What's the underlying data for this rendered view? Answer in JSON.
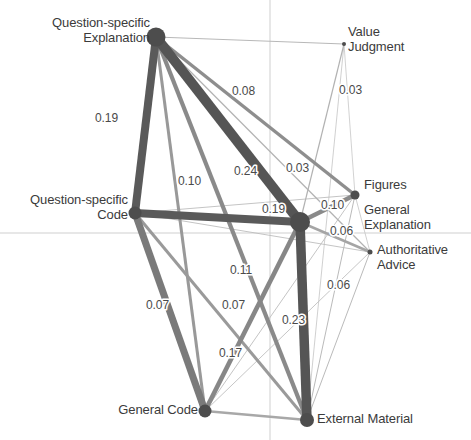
{
  "figure": {
    "type": "network-graph",
    "width": 471,
    "height": 440,
    "background_color": "#ffffff",
    "axis_color": "#cfcfcf",
    "node_color": "#4d4d4d",
    "edge_color_strong": "#5a5a5a",
    "edge_color_weak": "#b5b5b5",
    "label_color": "#3b3b3b"
  },
  "axes": {
    "horizontal_y": 233,
    "vertical_x": 270
  },
  "chart_data": {
    "type": "network",
    "title": "",
    "nodes": [
      {
        "id": "qs_explanation",
        "label": "Question-specific\nExplanation",
        "x": 156,
        "y": 37,
        "r": 9.5,
        "label_x": 150,
        "label_y": 16,
        "label_align": "right"
      },
      {
        "id": "qs_code",
        "label": "Question-specific\nCode",
        "x": 135,
        "y": 213,
        "r": 6.5,
        "label_x": 128,
        "label_y": 193,
        "label_align": "right"
      },
      {
        "id": "general_explanation",
        "label": "General\nExplanation",
        "x": 300,
        "y": 222,
        "r": 10,
        "label_x": 364,
        "label_y": 203,
        "label_align": "left"
      },
      {
        "id": "figures",
        "label": "Figures",
        "x": 355,
        "y": 195,
        "r": 4.5,
        "label_x": 364,
        "label_y": 178,
        "label_align": "left"
      },
      {
        "id": "value_judgment",
        "label": "Value\nJudgment",
        "x": 344,
        "y": 44,
        "r": 2,
        "label_x": 348,
        "label_y": 25,
        "label_align": "left"
      },
      {
        "id": "authoritative_advice",
        "label": "Authoritative\nAdvice",
        "x": 370,
        "y": 252,
        "r": 2.5,
        "label_x": 377,
        "label_y": 243,
        "label_align": "left"
      },
      {
        "id": "general_code",
        "label": "General Code",
        "x": 205,
        "y": 411,
        "r": 6.5,
        "label_x": 198,
        "label_y": 403,
        "label_align": "right"
      },
      {
        "id": "external_material",
        "label": "External Material",
        "x": 307,
        "y": 420,
        "r": 7,
        "label_x": 317,
        "label_y": 412,
        "label_align": "left"
      }
    ],
    "edges": [
      {
        "source": "qs_explanation",
        "target": "qs_code",
        "weight": 0.19,
        "width": 8.0,
        "color": "#5a5a5a",
        "label": "0.19",
        "label_x": 95,
        "label_y": 122
      },
      {
        "source": "qs_explanation",
        "target": "general_explanation",
        "weight": 0.24,
        "width": 10.0,
        "color": "#555555",
        "label": "0.24",
        "label_x": 234,
        "label_y": 175
      },
      {
        "source": "qs_explanation",
        "target": "figures",
        "weight": 0.08,
        "width": 3.4,
        "color": "#8e8e8e",
        "label": "0.08",
        "label_x": 232,
        "label_y": 95
      },
      {
        "source": "qs_explanation",
        "target": "external_material",
        "weight": 0.1,
        "width": 4.2,
        "color": "#8a8a8a",
        "label": "0.10",
        "label_x": 178,
        "label_y": 185
      },
      {
        "source": "qs_explanation",
        "target": "general_code",
        "weight": 0.07,
        "width": 3.0,
        "color": "#999999",
        "label": "0.07",
        "label_x": 146,
        "label_y": 309
      },
      {
        "source": "qs_explanation",
        "target": "value_judgment",
        "weight": 0.03,
        "width": 1.1,
        "color": "#b8b8b8",
        "label": "",
        "label_x": 0,
        "label_y": 0
      },
      {
        "source": "qs_explanation",
        "target": "authoritative_advice",
        "weight": 0.03,
        "width": 1.2,
        "color": "#b2b2b2",
        "label": "0.03",
        "label_x": 286,
        "label_y": 172
      },
      {
        "source": "qs_code",
        "target": "general_explanation",
        "weight": 0.19,
        "width": 8.0,
        "color": "#5a5a5a",
        "label": "0.19",
        "label_x": 262,
        "label_y": 213
      },
      {
        "source": "qs_code",
        "target": "external_material",
        "weight": 0.07,
        "width": 3.0,
        "color": "#9a9a9a",
        "label": "0.07",
        "label_x": 222,
        "label_y": 309
      },
      {
        "source": "qs_code",
        "target": "general_code",
        "weight": 0.17,
        "width": 7.0,
        "color": "#7a7a7a",
        "label": "0.17",
        "label_x": 219,
        "label_y": 357
      },
      {
        "source": "qs_code",
        "target": "figures",
        "weight": 0.02,
        "width": 0.9,
        "color": "#bdbdbd",
        "label": "",
        "label_x": 0,
        "label_y": 0
      },
      {
        "source": "qs_code",
        "target": "authoritative_advice",
        "weight": 0.02,
        "width": 0.9,
        "color": "#bdbdbd",
        "label": "",
        "label_x": 0,
        "label_y": 0
      },
      {
        "source": "general_explanation",
        "target": "external_material",
        "weight": 0.23,
        "width": 9.5,
        "color": "#555555",
        "label": "0.23",
        "label_x": 282,
        "label_y": 324
      },
      {
        "source": "general_explanation",
        "target": "general_code",
        "weight": 0.11,
        "width": 4.6,
        "color": "#878787",
        "label": "0.11",
        "label_x": 230,
        "label_y": 274
      },
      {
        "source": "general_explanation",
        "target": "figures",
        "weight": 0.1,
        "width": 4.2,
        "color": "#8a8a8a",
        "label": "0.10",
        "label_x": 321,
        "label_y": 209
      },
      {
        "source": "general_explanation",
        "target": "authoritative_advice",
        "weight": 0.06,
        "width": 2.5,
        "color": "#a5a5a5",
        "label": "0.06",
        "label_x": 330,
        "label_y": 235
      },
      {
        "source": "general_explanation",
        "target": "value_judgment",
        "weight": 0.03,
        "width": 1.2,
        "color": "#b2b2b2",
        "label": "0.03",
        "label_x": 339,
        "label_y": 94
      },
      {
        "source": "general_code",
        "target": "external_material",
        "weight": 0.06,
        "width": 2.4,
        "color": "#a8a8a8",
        "label": "0.06",
        "label_x": 327,
        "label_y": 289
      },
      {
        "source": "general_code",
        "target": "figures",
        "weight": 0.02,
        "width": 0.9,
        "color": "#bdbdbd",
        "label": "",
        "label_x": 0,
        "label_y": 0
      },
      {
        "source": "general_code",
        "target": "authoritative_advice",
        "weight": 0.02,
        "width": 0.9,
        "color": "#c0c0c0",
        "label": "",
        "label_x": 0,
        "label_y": 0
      },
      {
        "source": "external_material",
        "target": "figures",
        "weight": 0.02,
        "width": 1.0,
        "color": "#bababa",
        "label": "",
        "label_x": 0,
        "label_y": 0
      },
      {
        "source": "external_material",
        "target": "authoritative_advice",
        "weight": 0.02,
        "width": 1.0,
        "color": "#bababa",
        "label": "",
        "label_x": 0,
        "label_y": 0
      },
      {
        "source": "external_material",
        "target": "value_judgment",
        "weight": 0.01,
        "width": 0.8,
        "color": "#c4c4c4",
        "label": "",
        "label_x": 0,
        "label_y": 0
      },
      {
        "source": "figures",
        "target": "authoritative_advice",
        "weight": 0.01,
        "width": 0.8,
        "color": "#c4c4c4",
        "label": "",
        "label_x": 0,
        "label_y": 0
      },
      {
        "source": "figures",
        "target": "value_judgment",
        "weight": 0.01,
        "width": 0.8,
        "color": "#c6c6c6",
        "label": "",
        "label_x": 0,
        "label_y": 0
      }
    ]
  }
}
